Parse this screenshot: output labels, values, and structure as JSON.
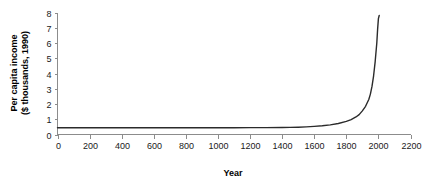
{
  "chart_data": {
    "type": "line",
    "title": "",
    "xlabel": "Year",
    "ylabel": "Per capita income ($ thousands, 1990)",
    "ylabel_line1": "Per capita income",
    "ylabel_line2": "($ thousands, 1990)",
    "xlim": [
      0,
      2200
    ],
    "ylim": [
      0,
      8
    ],
    "xticks": [
      0,
      200,
      400,
      600,
      800,
      1000,
      1200,
      1400,
      1600,
      1800,
      2000,
      2200
    ],
    "xtick_labels": [
      "0",
      "200",
      "400",
      "600",
      "800",
      "1000",
      "1200",
      "1400",
      "1600",
      "1800",
      "2000",
      "2200"
    ],
    "yticks": [
      0,
      1,
      2,
      3,
      4,
      5,
      6,
      7,
      8
    ],
    "ytick_labels": [
      "0",
      "1",
      "2",
      "3",
      "4",
      "5",
      "6",
      "7",
      "8"
    ],
    "grid": false,
    "legend": null,
    "series": [
      {
        "name": "Per capita income",
        "color": "#2b2b2b",
        "x": [
          0,
          100,
          200,
          300,
          400,
          500,
          600,
          700,
          800,
          900,
          1000,
          1100,
          1200,
          1300,
          1400,
          1450,
          1500,
          1550,
          1600,
          1650,
          1700,
          1750,
          1800,
          1830,
          1860,
          1880,
          1900,
          1920,
          1940,
          1950,
          1960,
          1970,
          1980,
          1990,
          1995,
          2000,
          2005
        ],
        "y": [
          0.44,
          0.44,
          0.44,
          0.44,
          0.44,
          0.44,
          0.44,
          0.44,
          0.44,
          0.44,
          0.44,
          0.44,
          0.45,
          0.45,
          0.46,
          0.47,
          0.48,
          0.5,
          0.53,
          0.57,
          0.63,
          0.72,
          0.86,
          0.98,
          1.15,
          1.3,
          1.55,
          1.85,
          2.3,
          2.65,
          3.15,
          3.85,
          4.8,
          6.0,
          6.9,
          7.6,
          7.8
        ]
      }
    ]
  }
}
